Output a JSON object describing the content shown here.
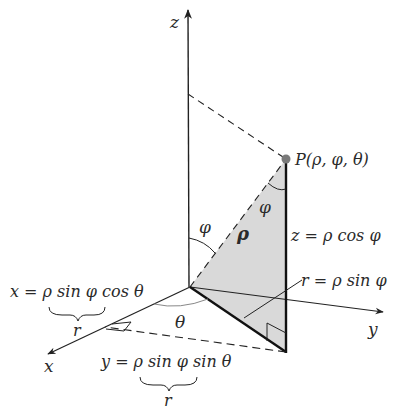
{
  "figure": {
    "type": "spherical-coordinates-diagram",
    "colors": {
      "line": "#222222",
      "shade": "#d9d9d9",
      "point": "#7a7a7a",
      "text": "#2a2a2a"
    },
    "axes": {
      "x_label": "x",
      "y_label": "y",
      "z_label": "z"
    },
    "point_label": "P(ρ, φ, θ)",
    "angle_labels": {
      "phi_at_origin": "φ",
      "phi_at_point": "φ",
      "theta": "θ"
    },
    "segment_labels": {
      "rho": "ρ",
      "z_eq": "z = ρ cos φ",
      "r_eq": "r = ρ sin φ"
    },
    "equations": {
      "x_eq": "x = ρ sin φ cos θ",
      "x_brace_label": "r",
      "y_eq": "y = ρ sin φ sin θ",
      "y_brace_label": "r"
    }
  }
}
